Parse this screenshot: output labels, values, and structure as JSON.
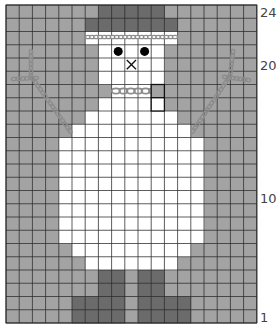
{
  "chart_data": {
    "type": "knitting-chart",
    "grid": {
      "columns": 19,
      "rows": 24,
      "origin_x": 6,
      "origin_y": 5,
      "cell_w": 13.2,
      "cell_h": 13.25,
      "row_numbering": "bottom-to-top"
    },
    "colors": {
      "background": "#a3a3a3",
      "snow": "#ffffff",
      "hat_legs": "#6b6b6b",
      "grid_line": "#2a2a2a",
      "grid_line_light": "#9a9a9a",
      "chain": "#8c8c8c"
    },
    "row_labels": [
      {
        "row": 24,
        "label": "24"
      },
      {
        "row": 20,
        "label": "20"
      },
      {
        "row": 10,
        "label": "10"
      },
      {
        "row": 1,
        "label": "1"
      }
    ],
    "fills": [
      {
        "row": 24,
        "color": "hat_legs",
        "cols": [
          7,
          8,
          9,
          10,
          11
        ]
      },
      {
        "row": 23,
        "color": "hat_legs",
        "cols": [
          6,
          7,
          8,
          9,
          10,
          11,
          12
        ]
      },
      {
        "row": 22,
        "color": "snow",
        "cols": [
          6,
          7,
          8,
          9,
          10,
          11,
          12
        ]
      },
      {
        "row": 21,
        "color": "snow",
        "cols": [
          7,
          8,
          9,
          10,
          11
        ]
      },
      {
        "row": 20,
        "color": "snow",
        "cols": [
          7,
          8,
          9,
          10,
          11
        ]
      },
      {
        "row": 19,
        "color": "snow",
        "cols": [
          7,
          8,
          9,
          10,
          11
        ]
      },
      {
        "row": 18,
        "color": "snow",
        "cols": [
          8,
          9,
          10
        ]
      },
      {
        "row": 17,
        "color": "snow",
        "cols": [
          7,
          8,
          9,
          10,
          11
        ]
      },
      {
        "row": 16,
        "color": "snow",
        "cols": [
          6,
          7,
          8,
          9,
          10,
          11,
          12
        ]
      },
      {
        "row": 15,
        "color": "snow",
        "cols": [
          5,
          6,
          7,
          8,
          9,
          10,
          11,
          12,
          13
        ]
      },
      {
        "row": 14,
        "color": "snow",
        "cols": [
          4,
          5,
          6,
          7,
          8,
          9,
          10,
          11,
          12,
          13,
          14
        ]
      },
      {
        "row": 13,
        "color": "snow",
        "cols": [
          4,
          5,
          6,
          7,
          8,
          9,
          10,
          11,
          12,
          13,
          14
        ]
      },
      {
        "row": 12,
        "color": "snow",
        "cols": [
          4,
          5,
          6,
          7,
          8,
          9,
          10,
          11,
          12,
          13,
          14
        ]
      },
      {
        "row": 11,
        "color": "snow",
        "cols": [
          4,
          5,
          6,
          7,
          8,
          9,
          10,
          11,
          12,
          13,
          14
        ]
      },
      {
        "row": 10,
        "color": "snow",
        "cols": [
          4,
          5,
          6,
          7,
          8,
          9,
          10,
          11,
          12,
          13,
          14
        ]
      },
      {
        "row": 9,
        "color": "snow",
        "cols": [
          4,
          5,
          6,
          7,
          8,
          9,
          10,
          11,
          12,
          13,
          14
        ]
      },
      {
        "row": 8,
        "color": "snow",
        "cols": [
          4,
          5,
          6,
          7,
          8,
          9,
          10,
          11,
          12,
          13,
          14
        ]
      },
      {
        "row": 7,
        "color": "snow",
        "cols": [
          4,
          5,
          6,
          7,
          8,
          9,
          10,
          11,
          12,
          13,
          14
        ]
      },
      {
        "row": 6,
        "color": "snow",
        "cols": [
          5,
          6,
          7,
          8,
          9,
          10,
          11,
          12,
          13
        ]
      },
      {
        "row": 5,
        "color": "snow",
        "cols": [
          6,
          7,
          8,
          9,
          10,
          11,
          12
        ]
      },
      {
        "row": 4,
        "color": "hat_legs",
        "cols": [
          7,
          8,
          10,
          11
        ]
      },
      {
        "row": 3,
        "color": "hat_legs",
        "cols": [
          7,
          8,
          10,
          11
        ]
      },
      {
        "row": 2,
        "color": "hat_legs",
        "cols": [
          5,
          6,
          7,
          8,
          10,
          11,
          12,
          13
        ]
      },
      {
        "row": 1,
        "color": "hat_legs",
        "cols": [
          5,
          6,
          7,
          8,
          10,
          11,
          12,
          13
        ]
      }
    ],
    "symbols": [
      {
        "type": "dot",
        "name": "left-eye",
        "row": 21,
        "col": 8
      },
      {
        "type": "dot",
        "name": "right-eye",
        "row": 21,
        "col": 10
      },
      {
        "type": "cross",
        "name": "nose",
        "row": 20,
        "col": 9
      },
      {
        "type": "outlined-cell",
        "name": "scarf-end",
        "row": 18,
        "col": 11
      },
      {
        "type": "outlined-cell",
        "name": "scarf-tail",
        "row": 17,
        "col": 11
      }
    ],
    "chains": [
      {
        "name": "hat-band-chain",
        "style": "small",
        "points": [
          [
            88,
            37
          ],
          [
            175,
            37
          ]
        ]
      },
      {
        "name": "scarf-chain",
        "style": "large",
        "points": [
          [
            116,
            91
          ],
          [
            153,
            91
          ]
        ]
      },
      {
        "name": "left-arm-upper",
        "style": "small",
        "points": [
          [
            31,
            52
          ],
          [
            31,
            76
          ]
        ]
      },
      {
        "name": "left-arm-branch",
        "style": "small",
        "points": [
          [
            14,
            79
          ],
          [
            36,
            78
          ]
        ]
      },
      {
        "name": "left-arm-main",
        "style": "small",
        "points": [
          [
            33,
            79
          ],
          [
            70,
            131
          ]
        ]
      },
      {
        "name": "right-arm-upper",
        "style": "small",
        "points": [
          [
            233,
            52
          ],
          [
            230,
            76
          ]
        ]
      },
      {
        "name": "right-arm-branch",
        "style": "small",
        "points": [
          [
            225,
            77
          ],
          [
            248,
            80
          ]
        ]
      },
      {
        "name": "right-arm-main",
        "style": "small",
        "points": [
          [
            228,
            79
          ],
          [
            193,
            131
          ]
        ]
      }
    ]
  }
}
